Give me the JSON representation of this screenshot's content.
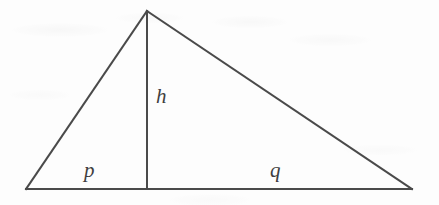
{
  "figure": {
    "kind": "geometry-diagram",
    "width": 439,
    "height": 205,
    "background_color": "#fdfdfd",
    "stroke_color": "#4a4a4a",
    "stroke_width": 2,
    "label_color": "#3f3f3f"
  },
  "labels": {
    "height": "h",
    "base_left": "p",
    "base_right": "q"
  },
  "geometry": {
    "vertices": {
      "apex": {
        "x": 147,
        "y": 11
      },
      "bottom_left": {
        "x": 26,
        "y": 189
      },
      "bottom_right": {
        "x": 412,
        "y": 189
      },
      "foot_of_altitude": {
        "x": 147,
        "y": 189
      }
    },
    "segments": [
      {
        "name": "left-side",
        "from": "apex",
        "to": "bottom_left"
      },
      {
        "name": "right-side",
        "from": "apex",
        "to": "bottom_right"
      },
      {
        "name": "base",
        "from": "bottom_left",
        "to": "bottom_right"
      },
      {
        "name": "altitude",
        "from": "apex",
        "to": "foot_of_altitude",
        "label": "h"
      }
    ],
    "label_positions": {
      "h": {
        "x": 163,
        "y": 97
      },
      "p": {
        "x": 91,
        "y": 171
      },
      "q": {
        "x": 277,
        "y": 171
      }
    }
  }
}
